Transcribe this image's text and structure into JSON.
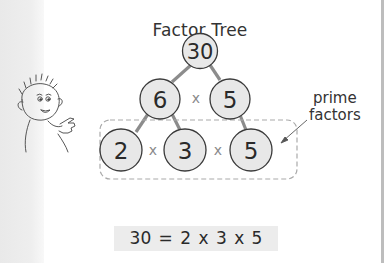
{
  "title": "Factor Tree",
  "tree": {
    "root": "30",
    "level1": [
      "6",
      "5"
    ],
    "level1_operator": "x",
    "level2": [
      "2",
      "3",
      "5"
    ],
    "level2_operators": [
      "x",
      "x"
    ]
  },
  "annotation": {
    "line1": "prime",
    "line2": "factors"
  },
  "equation": "30 = 2 x 3 x 5",
  "colors": {
    "node_fill": "#e8e8e8",
    "node_stroke": "#3a3a3a",
    "edge": "#8c8c8c",
    "dashed_box": "#aaaaaa",
    "equation_bg": "#ececec"
  }
}
